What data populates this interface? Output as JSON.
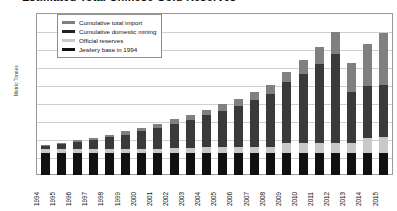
{
  "chart_data": {
    "type": "bar",
    "stacked": true,
    "title": "Estimated Total Chinese Gold Reserves",
    "xlabel": "",
    "ylabel": "Metric Tonnes",
    "ylim": [
      0,
      18000
    ],
    "ytick_step": 2000,
    "grid": true,
    "legend_position": "top-left",
    "ytick_labels": [
      "18,000",
      "16,000",
      "14,000",
      "12,000",
      "10,000",
      "8,000",
      "6,000",
      "4,000",
      "2,000",
      "0"
    ],
    "categories": [
      "1994",
      "1995",
      "1996",
      "1997",
      "1998",
      "1999",
      "2000",
      "2001",
      "2002",
      "2003",
      "2004",
      "2005",
      "2006",
      "2007",
      "2008",
      "2009",
      "2010",
      "2011",
      "2012",
      "2013",
      "2014",
      "2015"
    ],
    "series": [
      {
        "name": "Jewlery base in 1994",
        "color": "#111111",
        "values": [
          2500,
          2500,
          2500,
          2500,
          2500,
          2500,
          2500,
          2500,
          2500,
          2500,
          2500,
          2500,
          2500,
          2500,
          2500,
          2500,
          2500,
          2500,
          2500,
          2500,
          2500,
          2500
        ]
      },
      {
        "name": "Official reserves",
        "color": "#c9c9c9",
        "values": [
          400,
          400,
          400,
          400,
          400,
          400,
          400,
          400,
          500,
          500,
          600,
          600,
          600,
          600,
          600,
          1050,
          1050,
          1050,
          1050,
          1050,
          1650,
          1750
        ]
      },
      {
        "name": "Cumulative domestic mining",
        "color": "#3a3a3a",
        "values": [
          300,
          500,
          750,
          1000,
          1300,
          1600,
          1950,
          2300,
          2700,
          3100,
          3550,
          4050,
          4600,
          5250,
          5950,
          6750,
          7700,
          8750,
          9900,
          5700,
          5700,
          5800
        ]
      },
      {
        "name": "Cumulative total import",
        "color": "#808080",
        "values": [
          100,
          150,
          200,
          250,
          300,
          350,
          400,
          450,
          500,
          550,
          600,
          700,
          800,
          900,
          1000,
          1200,
          1500,
          1900,
          2400,
          3250,
          4750,
          5750
        ]
      }
    ],
    "series_order_bottom_to_top": [
      "Jewlery base in 1994",
      "Official reserves",
      "Cumulative domestic mining",
      "Cumulative total import"
    ],
    "bar_totals": [
      3300,
      3550,
      3850,
      4150,
      4500,
      4850,
      5250,
      5650,
      6200,
      6650,
      7250,
      7850,
      8500,
      9250,
      10050,
      11500,
      12750,
      14200,
      15850,
      12500,
      14600,
      15800
    ]
  },
  "legend": {
    "items": [
      {
        "label": "Cumulative total import"
      },
      {
        "label": "Cumulative domestic mining"
      },
      {
        "label": "Official reserves"
      },
      {
        "label": "Jewlery base in 1994"
      }
    ]
  }
}
